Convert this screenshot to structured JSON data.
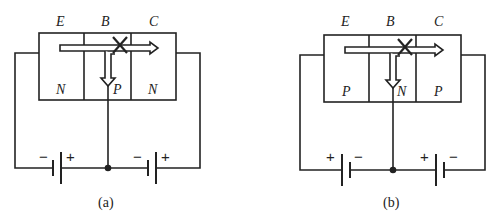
{
  "diagram": {
    "panels": [
      {
        "id": "a",
        "caption": "(a)",
        "terminals": {
          "emitter": "E",
          "base": "B",
          "collector": "C"
        },
        "regions": [
          "N",
          "P",
          "N"
        ],
        "batteries": [
          {
            "left_sign": "−",
            "right_sign": "+"
          },
          {
            "left_sign": "−",
            "right_sign": "+"
          }
        ]
      },
      {
        "id": "b",
        "caption": "(b)",
        "terminals": {
          "emitter": "E",
          "base": "B",
          "collector": "C"
        },
        "regions": [
          "P",
          "N",
          "P"
        ],
        "batteries": [
          {
            "left_sign": "+",
            "right_sign": "−"
          },
          {
            "left_sign": "+",
            "right_sign": "−"
          }
        ]
      }
    ],
    "colors": {
      "line": "#222222",
      "background": "#ffffff"
    }
  }
}
